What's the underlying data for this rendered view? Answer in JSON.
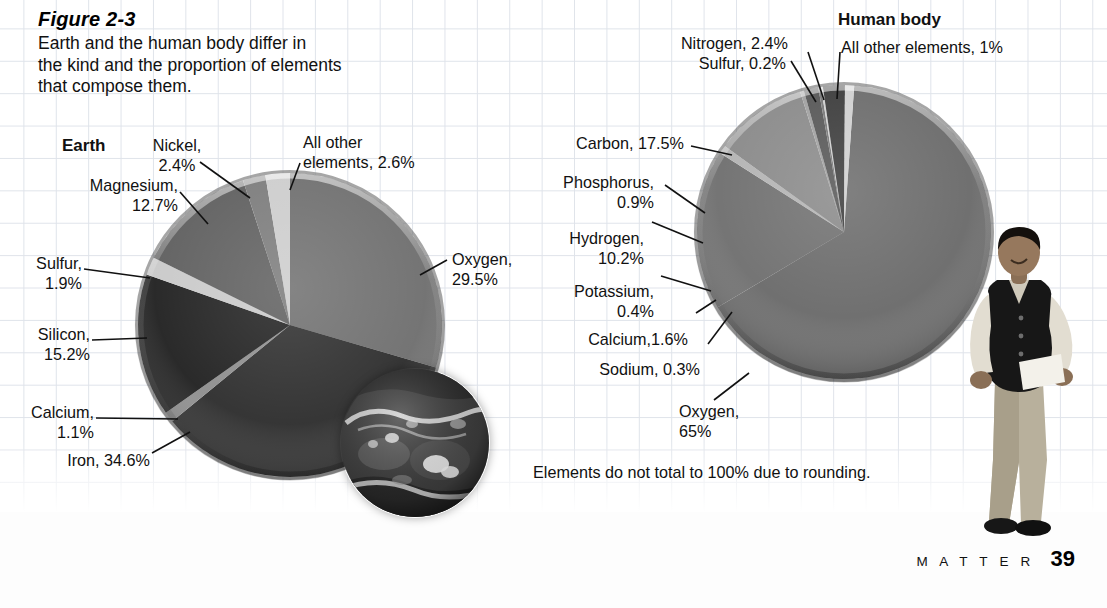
{
  "figure": {
    "number": "Figure 2-3",
    "caption_line1": "Earth and the human body differ in",
    "caption_line2": "the kind and the proportion of elements",
    "caption_line3": "that compose them."
  },
  "footnote": "Elements do not total to 100% due to rounding.",
  "footer": {
    "section": "M A T T E R",
    "page": "39"
  },
  "earth_chart": {
    "title": "Earth",
    "labels": {
      "nickel": "Nickel,\n2.4%",
      "all_other": "All other\nelements, 2.6%",
      "magnesium": "Magnesium,\n12.7%",
      "sulfur": "Sulfur,\n1.9%",
      "silicon": "Silicon,\n15.2%",
      "calcium": "Calcium,\n1.1%",
      "iron": "Iron, 34.6%",
      "oxygen": "Oxygen,\n29.5%"
    }
  },
  "body_chart": {
    "title": "Human body",
    "labels": {
      "nitrogen": "Nitrogen, 2.4%",
      "sulfur": "Sulfur, 0.2%",
      "all_other": "All other elements, 1%",
      "carbon": "Carbon, 17.5%",
      "phosphorus": "Phosphorus,\n0.9%",
      "hydrogen": "Hydrogen,\n10.2%",
      "potassium": "Potassium,\n0.4%",
      "calcium": "Calcium,1.6%",
      "sodium": "Sodium, 0.3%",
      "oxygen": "Oxygen,\n65%"
    }
  },
  "chart_data": [
    {
      "type": "pie",
      "title": "Earth",
      "units": "percent",
      "note": "Elements do not total to 100% due to rounding.",
      "categories": [
        "Oxygen",
        "Iron",
        "Silicon",
        "Magnesium",
        "Sulfur",
        "Nickel",
        "Calcium",
        "All other elements"
      ],
      "values": [
        29.5,
        34.6,
        15.2,
        12.7,
        1.9,
        2.4,
        1.1,
        2.6
      ],
      "slices": [
        {
          "label": "Oxygen",
          "value": 29.5,
          "color": "#6d6d6d"
        },
        {
          "label": "Iron",
          "value": 34.6,
          "color": "#2b2b2b"
        },
        {
          "label": "Calcium",
          "value": 1.1,
          "color": "#8d8d8d"
        },
        {
          "label": "Silicon",
          "value": 15.2,
          "color": "#1f1f1f"
        },
        {
          "label": "Sulfur",
          "value": 1.9,
          "color": "#c9c9c9"
        },
        {
          "label": "Magnesium",
          "value": 12.7,
          "color": "#5d5d5d"
        },
        {
          "label": "Nickel",
          "value": 2.4,
          "color": "#7a7a7a"
        },
        {
          "label": "All other elements",
          "value": 2.6,
          "color": "#cccccc"
        }
      ],
      "legend": "none",
      "labels_position": "callouts"
    },
    {
      "type": "pie",
      "title": "Human body",
      "units": "percent",
      "note": "Elements do not total to 100% due to rounding.",
      "categories": [
        "Oxygen",
        "Carbon",
        "Hydrogen",
        "Nitrogen",
        "Calcium",
        "Phosphorus",
        "Potassium",
        "Sulfur",
        "Sodium",
        "All other elements"
      ],
      "values": [
        65,
        17.5,
        10.2,
        2.4,
        1.6,
        0.9,
        0.4,
        0.2,
        0.3,
        1
      ],
      "slices": [
        {
          "label": "Oxygen",
          "value": 65,
          "color": "#6a6a6a"
        },
        {
          "label": "Carbon",
          "value": 17.5,
          "color": "#6f6f6f"
        },
        {
          "label": "Phosphorus",
          "value": 0.9,
          "color": "#b3b3b3"
        },
        {
          "label": "Hydrogen",
          "value": 10.2,
          "color": "#898989"
        },
        {
          "label": "Potassium",
          "value": 0.4,
          "color": "#a0a0a0"
        },
        {
          "label": "Calcium",
          "value": 1.6,
          "color": "#555555"
        },
        {
          "label": "Sodium",
          "value": 0.3,
          "color": "#777777"
        },
        {
          "label": "Sulfur",
          "value": 0.2,
          "color": "#d0d0d0"
        },
        {
          "label": "Nitrogen",
          "value": 2.4,
          "color": "#3a3a3a"
        },
        {
          "label": "All other elements",
          "value": 1,
          "color": "#cfcfcf"
        }
      ],
      "legend": "none",
      "labels_position": "callouts"
    }
  ],
  "colors": {
    "grid_line": "#dfe3ea",
    "page_background": "#ffffff",
    "text": "#111111"
  }
}
